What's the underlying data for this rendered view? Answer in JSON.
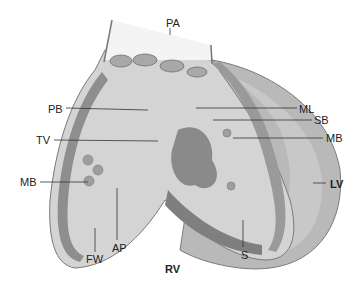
{
  "diagram": {
    "colors": {
      "background": "#ffffff",
      "tissue_light": "#d2d2d2",
      "tissue_mid": "#b4b4b4",
      "tissue_dark": "#8a8a8a",
      "outline": "#6e6e6e",
      "label_text": "#222222",
      "leader_line": "#333333"
    },
    "labels": [
      {
        "id": "PA",
        "text": "PA",
        "meaning": "pulmonary artery",
        "x": 166,
        "y": 17,
        "bold": false
      },
      {
        "id": "PB",
        "text": "PB",
        "x": 48,
        "y": 104,
        "bold": false
      },
      {
        "id": "ML",
        "text": "ML",
        "x": 299,
        "y": 104,
        "bold": false
      },
      {
        "id": "SB",
        "text": "SB",
        "x": 314,
        "y": 115,
        "bold": false
      },
      {
        "id": "TV",
        "text": "TV",
        "x": 36,
        "y": 133,
        "bold": false
      },
      {
        "id": "MB_right",
        "text": "MB",
        "x": 326,
        "y": 132,
        "bold": false
      },
      {
        "id": "MB_left",
        "text": "MB",
        "x": 20,
        "y": 176,
        "bold": false
      },
      {
        "id": "LV",
        "text": "LV",
        "x": 330,
        "y": 178,
        "bold": true
      },
      {
        "id": "AP",
        "text": "AP",
        "x": 112,
        "y": 242,
        "bold": false
      },
      {
        "id": "FW",
        "text": "FW",
        "x": 86,
        "y": 253,
        "bold": false
      },
      {
        "id": "S",
        "text": "S",
        "x": 241,
        "y": 249,
        "bold": false
      },
      {
        "id": "RV",
        "text": "RV",
        "x": 165,
        "y": 263,
        "bold": true
      }
    ]
  }
}
